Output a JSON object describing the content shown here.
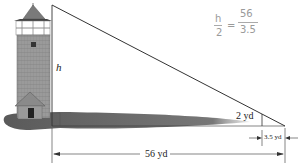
{
  "figure": {
    "type": "similar-triangles-diagram",
    "labels": {
      "tower_height": "h",
      "stick_height": "2 yd",
      "stick_shadow": "3.5 yd",
      "total_shadow": "56 yd"
    },
    "handwritten_note": {
      "num_left": "h",
      "den_left": "2",
      "equals": "=",
      "num_right": "56",
      "den_right": "3.5"
    },
    "colors": {
      "line": "#333333",
      "shadow": "#6e6e6e",
      "tower": "#8a8a8a",
      "handwriting": "#9a9a9a"
    }
  }
}
